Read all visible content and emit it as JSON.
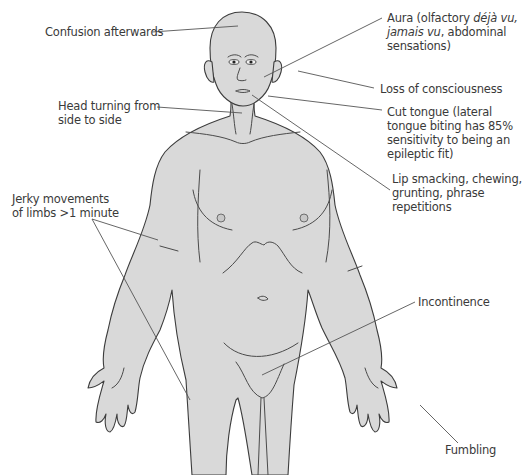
{
  "diagram": {
    "colors": {
      "skin_fill": "#d9d9d9",
      "outline": "#3c3c3c",
      "leader_line": "#555555",
      "text": "#3a3a3a",
      "background": "#ffffff"
    },
    "labels": {
      "confusion": "Confusion afterwards",
      "head_turning_1": "Head turning from",
      "head_turning_2": "side to side",
      "jerky_1": "Jerky movements",
      "jerky_2": "of limbs >1 minute",
      "aura_1a": "Aura (olfactory ",
      "aura_1b": "déjà vu,",
      "aura_2a": "jamais vu",
      "aura_2b": ", abdominal",
      "aura_3": "sensations)",
      "loss": "Loss of consciousness",
      "tongue_1": "Cut tongue (lateral",
      "tongue_2": "tongue biting has 85%",
      "tongue_3": "sensitivity to being an",
      "tongue_4": "epileptic fit)",
      "lip_1": "Lip smacking, chewing,",
      "lip_2": "grunting, phrase",
      "lip_3": "repetitions",
      "incontinence": "Incontinence",
      "fumbling": "Fumbling"
    }
  }
}
